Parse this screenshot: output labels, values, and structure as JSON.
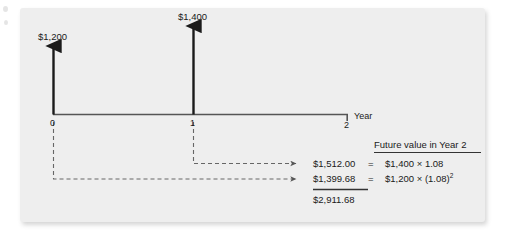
{
  "figure": {
    "timeline": {
      "axis_label": "Year",
      "ticks": [
        {
          "label": "0"
        },
        {
          "label": "1"
        },
        {
          "label": "2"
        }
      ],
      "cash_flows": [
        {
          "period": "0",
          "label": "$1,200"
        },
        {
          "period": "1",
          "label": "$1,400"
        }
      ]
    },
    "calculations": {
      "header": "Future value in Year 2",
      "rows": [
        {
          "value": "$1,512.00",
          "equals": "=",
          "expression_base": "$1,400 × 1.08",
          "expression_exponent": ""
        },
        {
          "value": "$1,399.68",
          "equals": "=",
          "expression_base": "$1,200 × (1.08)",
          "expression_exponent": "2"
        }
      ],
      "total": "$2,911.68"
    }
  },
  "colors": {
    "panel_background": "#eeeeee",
    "page_background": "#ffffff",
    "ink": "#1a1a1a",
    "axis": "#555555",
    "dashed": "#666666"
  }
}
